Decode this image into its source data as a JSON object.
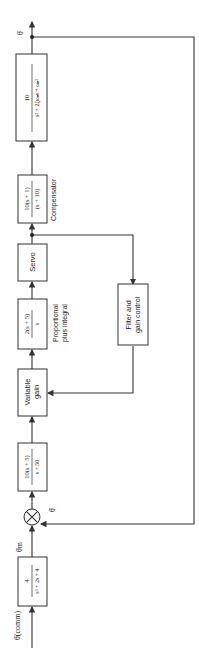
{
  "diagram": {
    "orientation": "rotated-90-ccw",
    "input_label": "θ̇(comm)",
    "prefilter": {
      "numerator": "4",
      "denominator": "s³ + 2s + 4"
    },
    "prefilter_output_label": "θ̇m",
    "summing_junction": {
      "signs": [
        "+",
        "−"
      ]
    },
    "feedback_label": "θ̇",
    "lead_lag": {
      "numerator": "10(s + 5)",
      "denominator": "s + 50"
    },
    "variable_gain": {
      "line1": "Variable",
      "line2": "gain"
    },
    "pi_controller": {
      "numerator": "2(s + 5)",
      "denominator": "s",
      "caption_line1": "Proportional",
      "caption_line2": "plus integral"
    },
    "servo": {
      "label": "Servo"
    },
    "compensator": {
      "numerator": "10(s + 1)",
      "denominator": "(s + 10)",
      "caption": "Compensator"
    },
    "plant": {
      "numerator": "10",
      "denominator": "s² + 2ζωₙs + ωₙ²"
    },
    "output_label": "θ̇",
    "filter": {
      "line1": "Filter and",
      "line2": "gain control"
    }
  }
}
